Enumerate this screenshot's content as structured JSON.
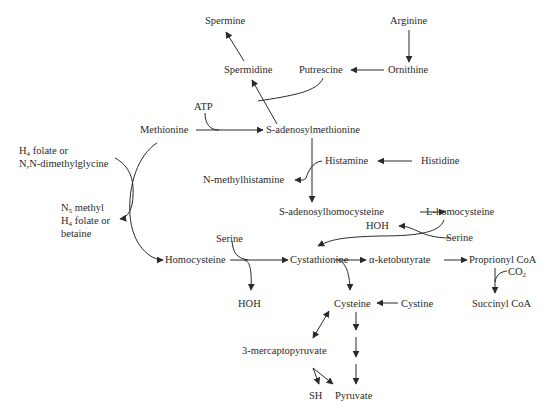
{
  "diagram": {
    "type": "metabolic-pathway",
    "line_color": "#2a2a2a",
    "nodes": {
      "spermine": "Spermine",
      "arginine": "Arginine",
      "spermidine": "Spermidine",
      "putrescine": "Putrescine",
      "ornithine": "Ornithine",
      "atp": "ATP",
      "methionine": "Methionine",
      "sam": "S-adenosylmethionine",
      "h4folate_line1_pre": "H",
      "h4folate_line1_sub": "4",
      "h4folate_line1_post": " folate or",
      "h4folate_line2": "N,N-dimethylglycine",
      "histamine": "Histamine",
      "histidine": "Histidine",
      "n_methylhistamine": "N-methylhistamine",
      "n5_line1_pre": "N",
      "n5_line1_sub": "5",
      "n5_line1_post": " methyl",
      "n5_line2_pre": "H",
      "n5_line2_sub": "4",
      "n5_line2_post": " folate or",
      "n5_line3": "betaine",
      "sah": "S-adenosylhomocysteine",
      "l_homocysteine": "L-homocysteine",
      "hoh_top": "HOH",
      "serine_right": "Serine",
      "serine_left": "Serine",
      "homocysteine": "Homocysteine",
      "cystathionine": "Cystathionine",
      "alpha_ketobutyrate": "α-ketobutyrate",
      "proprionyl_coa": "Proprionyl CoA",
      "co2_pre": "CO",
      "co2_sub": "2",
      "hoh_bottom": "HOH",
      "cysteine": "Cysteine",
      "cystine": "Cystine",
      "succinyl_coa": "Succinyl CoA",
      "mercaptopyruvate": "3-mercaptopyruvate",
      "sh": "SH",
      "pyruvate": "Pyruvate"
    },
    "edges": [
      {
        "from": "Arginine",
        "to": "Ornithine"
      },
      {
        "from": "Ornithine",
        "to": "Putrescine"
      },
      {
        "from": "Putrescine",
        "to": "Spermidine",
        "via": "S-adenosylmethionine"
      },
      {
        "from": "Spermidine",
        "to": "Spermine"
      },
      {
        "from": "Methionine",
        "to": "S-adenosylmethionine",
        "cofactor": "ATP"
      },
      {
        "from": "S-adenosylmethionine",
        "to": "S-adenosylhomocysteine"
      },
      {
        "from": "Histidine",
        "to": "Histamine"
      },
      {
        "from": "Histamine",
        "to": "N-methylhistamine"
      },
      {
        "from": "S-adenosylhomocysteine",
        "to": "L-homocysteine"
      },
      {
        "from": "L-homocysteine",
        "to": "Cystathionine",
        "cofactor_in": "Serine",
        "product": "HOH"
      },
      {
        "from": "Methionine",
        "to": "Homocysteine"
      },
      {
        "from": "H4 folate or N,N-dimethylglycine",
        "to": "N5 methyl H4 folate or betaine"
      },
      {
        "from": "Homocysteine",
        "to": "Cystathionine",
        "cofactor_in": "Serine",
        "product": "HOH"
      },
      {
        "from": "Cystathionine",
        "to": "α-ketobutyrate"
      },
      {
        "from": "α-ketobutyrate",
        "to": "Proprionyl CoA"
      },
      {
        "from": "Proprionyl CoA",
        "to": "Succinyl CoA",
        "product": "CO2"
      },
      {
        "from": "Cystathionine",
        "to": "Cysteine"
      },
      {
        "from": "Cystine",
        "to": "Cysteine"
      },
      {
        "from": "Cysteine",
        "to": "3-mercaptopyruvate",
        "bidirectional": true
      },
      {
        "from": "3-mercaptopyruvate",
        "to": "SH"
      },
      {
        "from": "3-mercaptopyruvate",
        "to": "Pyruvate"
      },
      {
        "from": "Cysteine",
        "to": "Pyruvate",
        "steps": 3
      }
    ]
  }
}
